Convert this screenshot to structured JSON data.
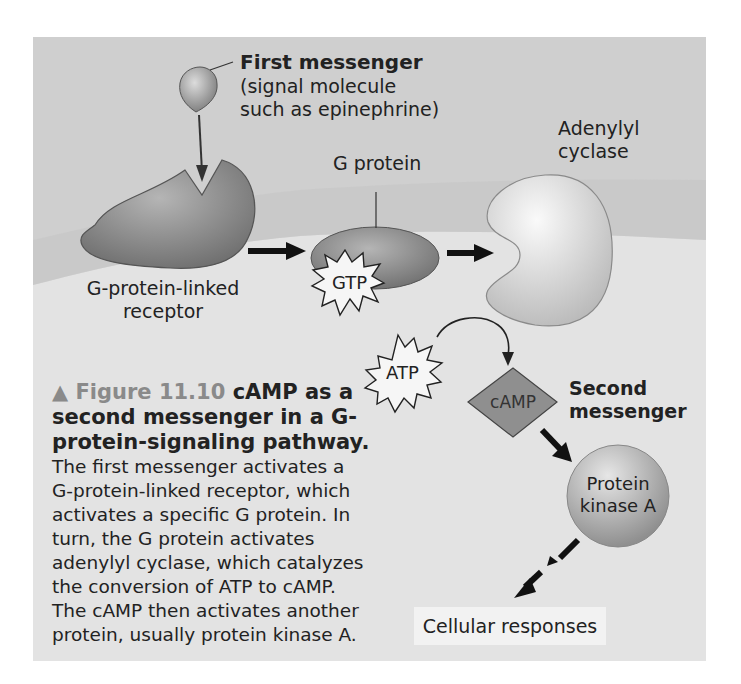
{
  "figure": {
    "number_label": "▲ Figure 11.10",
    "title_lines": [
      "cAMP as a",
      "second messenger in a G-",
      "protein-signaling pathway."
    ],
    "body_lines": [
      "The first messenger activates a",
      "G-protein-linked receptor, which",
      "activates a specific G protein. In",
      "turn, the G protein activates",
      "adenylyl cyclase, which catalyzes",
      "the conversion of ATP to cAMP.",
      "The cAMP then activates another",
      "protein, usually protein kinase A."
    ]
  },
  "labels": {
    "first_messenger_title": "First messenger",
    "first_messenger_line1": "(signal molecule",
    "first_messenger_line2": "such as epinephrine)",
    "g_protein": "G protein",
    "adenylyl_line1": "Adenylyl",
    "adenylyl_line2": "cyclase",
    "receptor_line1": "G-protein-linked",
    "receptor_line2": "receptor",
    "gtp": "GTP",
    "atp": "ATP",
    "camp": "cAMP",
    "second_messenger_line1": "Second",
    "second_messenger_line2": "messenger",
    "pka_line1": "Protein",
    "pka_line2": "kinase A",
    "cellular_responses": "Cellular responses"
  },
  "colors": {
    "extracellular": "#cfcfcf",
    "cytoplasm": "#e6e6e6",
    "membrane_band": "#c2c2c2",
    "molecule_dark": "#8d8d8d",
    "molecule_light": "#e8e8e8",
    "text": "#222222",
    "figure_number": "#8a8a8a"
  }
}
